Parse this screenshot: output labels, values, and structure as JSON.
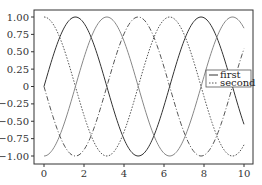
{
  "chart_data": {
    "type": "line",
    "title": "",
    "xlabel": "",
    "ylabel": "",
    "xlim": [
      -0.5,
      10.5
    ],
    "ylim": [
      -1.1,
      1.1
    ],
    "grid": false,
    "legend_position": "center right",
    "x_ticks": [
      "0",
      "2",
      "4",
      "6",
      "8",
      "10"
    ],
    "y_ticks": [
      "1.00",
      "0.75",
      "0.50",
      "0.25",
      "0",
      "−0.25",
      "−0.50",
      "−0.75",
      "−1.00"
    ],
    "x_range": [
      0,
      10
    ],
    "series": [
      {
        "name": "first",
        "function": "sin(x)",
        "style": "solid",
        "color": "#333333",
        "in_legend": true
      },
      {
        "name": "second",
        "function": "cos(x)",
        "style": "dotted",
        "color": "#555555",
        "in_legend": true
      },
      {
        "name": "",
        "function": "-cos(x)",
        "style": "solid",
        "color": "#888888",
        "in_legend": false
      },
      {
        "name": "",
        "function": "-sin(x)",
        "style": "dashdot",
        "color": "#555555",
        "in_legend": false
      }
    ]
  },
  "legend": {
    "items": [
      {
        "label": "first"
      },
      {
        "label": "second"
      }
    ]
  }
}
